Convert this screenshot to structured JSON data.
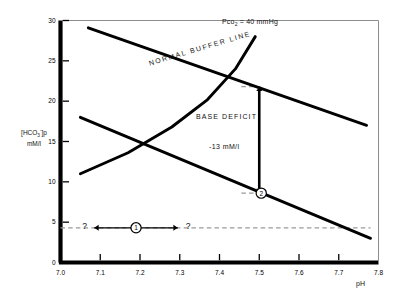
{
  "figure": {
    "background": "#ffffff",
    "ink": "#000000",
    "dash_color": "#9a9a9a"
  },
  "axes": {
    "x": {
      "label": "pH",
      "min": 7.0,
      "max": 7.8,
      "ticks": [
        7.0,
        7.1,
        7.2,
        7.3,
        7.4,
        7.5,
        7.6,
        7.7,
        7.8
      ],
      "tick_labels": [
        "7.0",
        "7.1",
        "7.2",
        "7.3",
        "7.4",
        "7.5",
        "7.6",
        "7.7",
        "7.8"
      ]
    },
    "y": {
      "label_line1_pre": "[HCO",
      "label_line1_sub": "3",
      "label_line1_sup": "-",
      "label_line1_post": "]p",
      "label_line2": "mM/l",
      "min": 0,
      "max": 30,
      "ticks": [
        0,
        5,
        10,
        15,
        20,
        25,
        30
      ],
      "tick_labels": [
        "0",
        "5",
        "10",
        "15",
        "20",
        "25",
        "30"
      ]
    }
  },
  "annotations": {
    "normal_buffer_line": "NORMAL BUFFER LINE",
    "pco2_pre": "Pco",
    "pco2_sub": "2",
    "pco2_post": " = 40 mmHg",
    "base_deficit_title": "BASE DEFICIT",
    "base_deficit_value": "-13 mM/l",
    "question_left": "?",
    "question_right": "?",
    "marker_one": "1",
    "marker_two": "2"
  },
  "chart_data": {
    "type": "line",
    "title": "",
    "xlabel": "pH",
    "ylabel": "[HCO3-]p mM/l",
    "xlim": [
      7.0,
      7.8
    ],
    "ylim": [
      0,
      30
    ],
    "grid": false,
    "legend": "none",
    "series": [
      {
        "name": "NORMAL BUFFER LINE",
        "style": "solid-thick",
        "points": [
          [
            7.07,
            29.1
          ],
          [
            7.77,
            17.0
          ]
        ]
      },
      {
        "name": "Pco2 = 40 mmHg",
        "style": "solid-thick-curved",
        "points": [
          [
            7.05,
            11.0
          ],
          [
            7.17,
            13.6
          ],
          [
            7.28,
            16.8
          ],
          [
            7.37,
            20.2
          ],
          [
            7.44,
            24.0
          ],
          [
            7.49,
            28.0
          ]
        ]
      },
      {
        "name": "metabolic acidosis line through point 2",
        "style": "solid-thick",
        "points": [
          [
            7.05,
            18.0
          ],
          [
            7.78,
            3.0
          ]
        ]
      }
    ],
    "reference_lines": [
      {
        "name": "base-deficit-level",
        "style": "dashed",
        "orientation": "horizontal",
        "y": 4.3,
        "x_from": 7.0,
        "x_to": 7.78
      },
      {
        "name": "base-deficit-top-tick",
        "style": "dashed",
        "orientation": "horizontal",
        "y": 21.8,
        "x_from": 7.455,
        "x_to": 7.5
      },
      {
        "name": "base-deficit-bottom-tick",
        "style": "dashed",
        "orientation": "horizontal",
        "y": 8.6,
        "x_from": 7.455,
        "x_to": 7.5
      }
    ],
    "arrows": [
      {
        "name": "base-deficit-arrow",
        "orientation": "vertical",
        "x": 7.5,
        "y_from": 21.8,
        "y_to": 8.6,
        "heads": "both",
        "label": "-13 mM/l"
      },
      {
        "name": "uncertainty-arrow",
        "orientation": "horizontal",
        "y": 4.3,
        "x_from": 7.085,
        "x_to": 7.295,
        "heads": "both"
      }
    ],
    "markers": [
      {
        "label": "1",
        "x": 7.19,
        "y": 4.3,
        "shape": "circle-open"
      },
      {
        "label": "2",
        "x": 7.505,
        "y": 8.6,
        "shape": "circle-open"
      }
    ],
    "annotations": [
      {
        "text": "NORMAL BUFFER LINE",
        "x": 7.3,
        "y": 25.5,
        "rotation": -16.5
      },
      {
        "text": "Pco2 = 40 mmHg",
        "x": 7.47,
        "y": 28.6
      },
      {
        "text": "BASE DEFICIT",
        "x": 7.34,
        "y": 16.4
      },
      {
        "text": "-13 mM/l",
        "x": 7.37,
        "y": 13.3
      },
      {
        "text": "?",
        "x": 7.06,
        "y": 4.3
      },
      {
        "text": "?",
        "x": 7.32,
        "y": 4.3
      }
    ]
  }
}
